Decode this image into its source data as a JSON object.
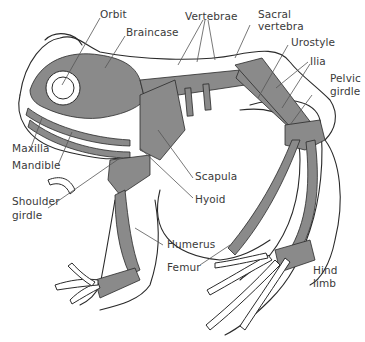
{
  "diagram": {
    "colors": {
      "bone": "#8a8a8a",
      "outline": "#2a2a2a",
      "background": "#ffffff",
      "label_text": "#3a3a3a",
      "leader_line": "#555555"
    },
    "labels": [
      {
        "id": "orbit",
        "text": "Orbit"
      },
      {
        "id": "braincase",
        "text": "Braincase"
      },
      {
        "id": "vertebrae",
        "text": "Vertebrae"
      },
      {
        "id": "sacral-vertebra-1",
        "text": "Sacral"
      },
      {
        "id": "sacral-vertebra-2",
        "text": "vertebra"
      },
      {
        "id": "urostyle",
        "text": "Urostyle"
      },
      {
        "id": "ilia",
        "text": "Ilia"
      },
      {
        "id": "pelvic-girdle-1",
        "text": "Pelvic"
      },
      {
        "id": "pelvic-girdle-2",
        "text": "girdle"
      },
      {
        "id": "maxilla",
        "text": "Maxilla"
      },
      {
        "id": "mandible",
        "text": "Mandible"
      },
      {
        "id": "scapula",
        "text": "Scapula"
      },
      {
        "id": "hyoid",
        "text": "Hyoid"
      },
      {
        "id": "shoulder-girdle-1",
        "text": "Shoulder"
      },
      {
        "id": "shoulder-girdle-2",
        "text": "girdle"
      },
      {
        "id": "humerus",
        "text": "Humerus"
      },
      {
        "id": "femur",
        "text": "Femur"
      },
      {
        "id": "hind-limb-1",
        "text": "Hind"
      },
      {
        "id": "hind-limb-2",
        "text": "limb"
      }
    ]
  }
}
